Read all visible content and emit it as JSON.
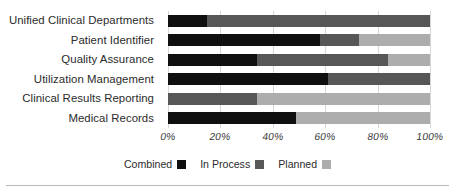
{
  "chart_data": {
    "type": "bar",
    "orientation": "horizontal",
    "stacked": true,
    "title": "",
    "xlabel": "",
    "ylabel": "",
    "xlim": [
      0,
      100
    ],
    "xtick_labels": [
      "0%",
      "20%",
      "40%",
      "60%",
      "80%",
      "100%"
    ],
    "xtick_values": [
      0,
      20,
      40,
      60,
      80,
      100
    ],
    "grid": true,
    "legend_position": "bottom-center",
    "categories": [
      "Unified Clinical Departments",
      "Patient Identifier",
      "Quality Assurance",
      "Utilization Management",
      "Clinical Results Reporting",
      "Medical Records"
    ],
    "series": [
      {
        "name": "Combined",
        "color": "#0f0f0f",
        "values": [
          15,
          58,
          34,
          61,
          0,
          49
        ]
      },
      {
        "name": "In Process",
        "color": "#575757",
        "values": [
          85,
          15,
          50,
          39,
          34,
          0
        ]
      },
      {
        "name": "Planned",
        "color": "#adadad",
        "values": [
          0,
          27,
          16,
          0,
          66,
          51
        ]
      }
    ]
  },
  "legend": {
    "items": [
      {
        "label": "Combined",
        "color": "#0f0f0f"
      },
      {
        "label": "In Process",
        "color": "#575757"
      },
      {
        "label": "Planned",
        "color": "#adadad"
      }
    ]
  },
  "colors": {
    "gridline": "#d7d7d7",
    "text": "#2b2b2b",
    "rule": "#b9b9b9",
    "background": "#ffffff"
  }
}
